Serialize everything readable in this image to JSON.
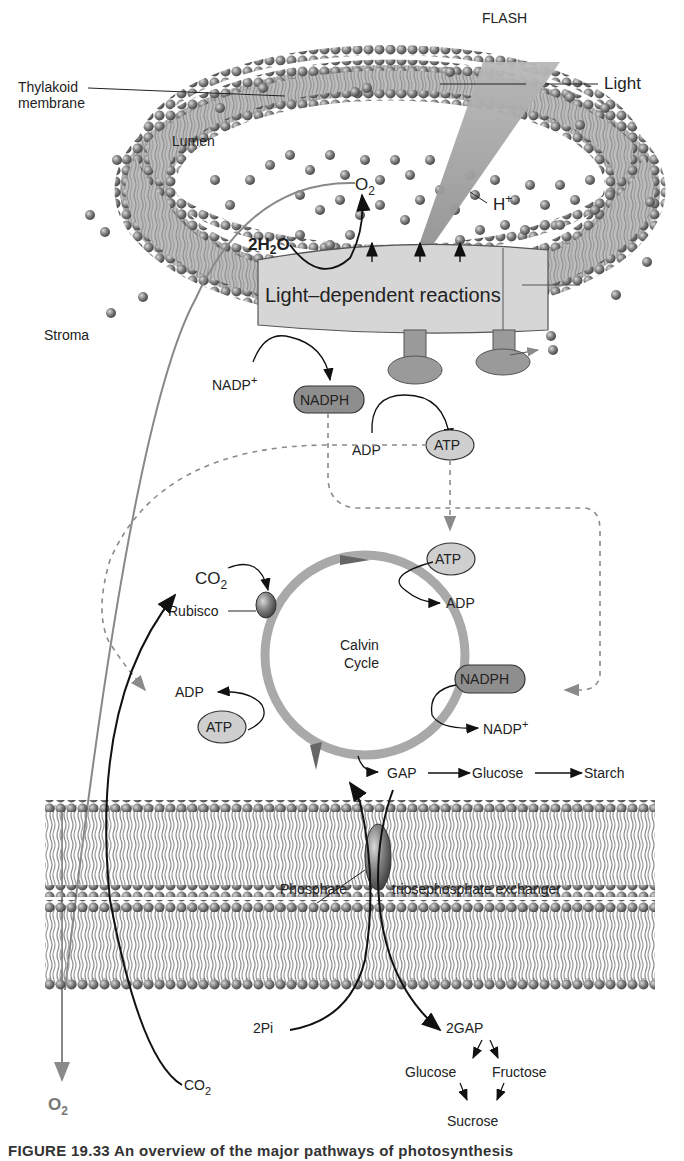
{
  "figure": {
    "caption_partial": "FIGURE 19.33 An overview of the major pathways of photosynthesis"
  },
  "labels": {
    "flash": "FLASH",
    "light": "Light",
    "thylakoid_membrane_1": "Thylakoid",
    "thylakoid_membrane_2": "membrane",
    "lumen": "Lumen",
    "o2_lumen": "O",
    "o2_lumen_sub": "2",
    "h_plus": "H",
    "h_plus_sup": "+",
    "water": "2H",
    "water_sub": "2",
    "water_o": "O",
    "light_dependent_reactions": "Light–dependent reactions",
    "stroma": "Stroma",
    "nadp_plus_top": "NADP",
    "nadp_plus_top_sup": "+",
    "nadph_top": "NADPH",
    "adp_top": "ADP",
    "atp_top": "ATP",
    "co2_cycle": "CO",
    "co2_cycle_sub": "2",
    "rubisco": "Rubisco",
    "atp_right": "ATP",
    "adp_right": "ADP",
    "calvin_1": "Calvin",
    "calvin_2": "Cycle",
    "nadph_right": "NADPH",
    "nadp_plus_right": "NADP",
    "nadp_plus_right_sup": "+",
    "adp_left": "ADP",
    "atp_left": "ATP",
    "gap": "GAP",
    "glucose_top": "Glucose",
    "starch": "Starch",
    "phosphate": "Phosphate",
    "exchanger": "triosephosphate exchanger",
    "two_pi": "2Pi",
    "two_gap": "2GAP",
    "o2_out": "O",
    "o2_out_sub": "2",
    "co2_in": "CO",
    "co2_in_sub": "2",
    "glucose_bottom": "Glucose",
    "fructose": "Fructose",
    "sucrose": "Sucrose"
  },
  "colors": {
    "membrane_head": "#7a7a7a",
    "membrane_tail": "#8c8c8c",
    "cycle_ring": "#a9a9a9",
    "box_fill": "#d6d6d6",
    "nadph_fill": "#8e8e8e",
    "atp_fill": "#cfcfcf",
    "arrow_black": "#111111",
    "arrow_gray": "#8a8a8a",
    "flash_beam": "#a0a0a0"
  }
}
